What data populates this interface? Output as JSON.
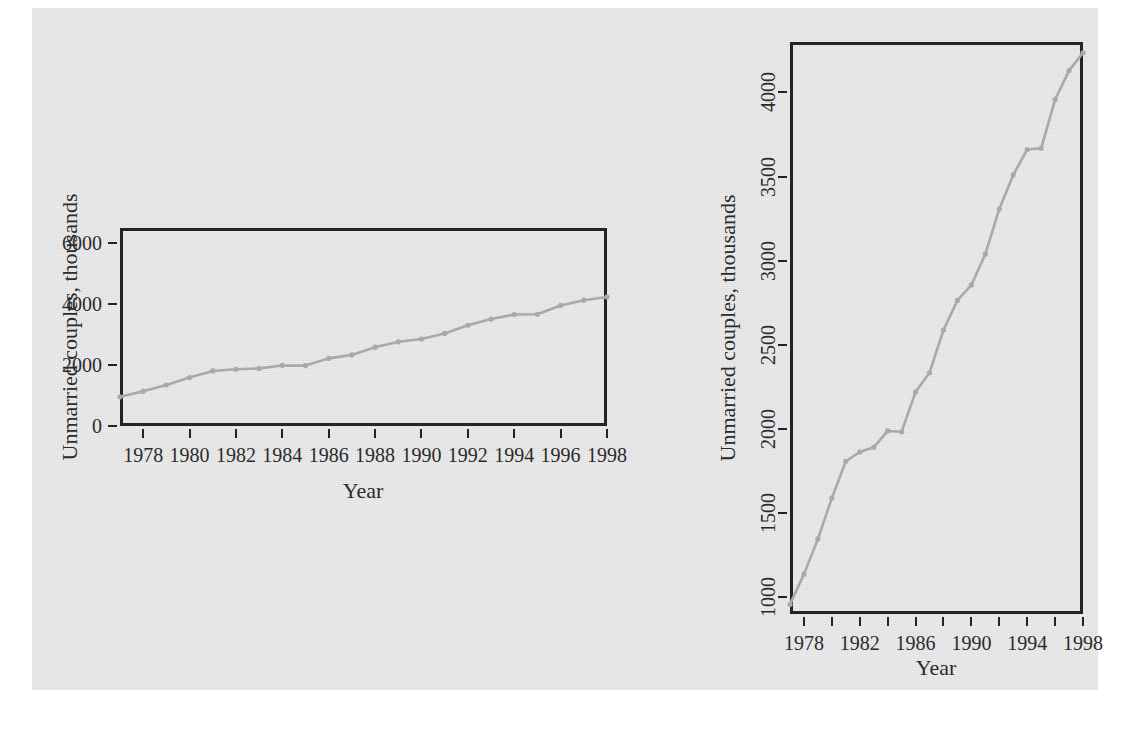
{
  "page": {
    "background_color": "#ffffff",
    "scan_background_color": "#e3e3e3",
    "axis_color": "#232323",
    "line_color": "#a9a9a9"
  },
  "chart_data": [
    {
      "id": "left-panel",
      "type": "line",
      "title": "",
      "xlabel": "Year",
      "ylabel": "Unmarried couples, thousands",
      "xlim": [
        1977,
        1998
      ],
      "ylim": [
        0,
        6500
      ],
      "xticks": [
        1978,
        1980,
        1982,
        1984,
        1986,
        1988,
        1990,
        1992,
        1994,
        1996,
        1998
      ],
      "xticklabels": [
        "1978",
        "1980",
        "1982",
        "1984",
        "1986",
        "1988",
        "1990",
        "1992",
        "1994",
        "1996",
        "1998"
      ],
      "yticks": [
        0,
        2000,
        4000,
        6000
      ],
      "yticklabels": [
        "0",
        "2000",
        "4000",
        "6000"
      ],
      "grid": false,
      "legend": false,
      "marker": "point",
      "x": [
        1977,
        1978,
        1979,
        1980,
        1981,
        1982,
        1983,
        1984,
        1985,
        1986,
        1987,
        1988,
        1989,
        1990,
        1991,
        1992,
        1993,
        1994,
        1995,
        1996,
        1997,
        1998
      ],
      "values": [
        957,
        1137,
        1346,
        1589,
        1808,
        1863,
        1891,
        1988,
        1983,
        2220,
        2334,
        2588,
        2764,
        2856,
        3039,
        3308,
        3510,
        3661,
        3668,
        3958,
        4130,
        4236
      ]
    },
    {
      "id": "right-panel",
      "type": "line",
      "title": "",
      "xlabel": "Year",
      "ylabel": "Unmarried couples, thousands",
      "xlim": [
        1977,
        1998
      ],
      "ylim": [
        900,
        4300
      ],
      "xticks": [
        1978,
        1980,
        1982,
        1984,
        1986,
        1988,
        1990,
        1992,
        1994,
        1996,
        1998
      ],
      "xticklabels": [
        "1978",
        "",
        "1982",
        "",
        "1986",
        "",
        "1990",
        "",
        "1994",
        "",
        "1998"
      ],
      "yticks": [
        1000,
        1500,
        2000,
        2500,
        3000,
        3500,
        4000
      ],
      "yticklabels": [
        "1000",
        "1500",
        "2000",
        "2500",
        "3000",
        "3500",
        "4000"
      ],
      "grid": false,
      "legend": false,
      "marker": "point",
      "x": [
        1977,
        1978,
        1979,
        1980,
        1981,
        1982,
        1983,
        1984,
        1985,
        1986,
        1987,
        1988,
        1989,
        1990,
        1991,
        1992,
        1993,
        1994,
        1995,
        1996,
        1997,
        1998
      ],
      "values": [
        957,
        1137,
        1346,
        1589,
        1808,
        1863,
        1891,
        1988,
        1983,
        2220,
        2334,
        2588,
        2764,
        2856,
        3039,
        3308,
        3510,
        3661,
        3668,
        3958,
        4130,
        4236
      ]
    }
  ]
}
